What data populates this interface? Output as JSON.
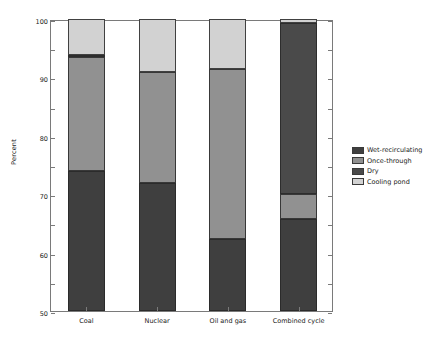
{
  "chart_data": {
    "type": "bar",
    "subtype": "stacked-bar-100-percent",
    "title": "",
    "xlabel": "",
    "ylabel": "Percent",
    "ylim": [
      0,
      100
    ],
    "yticks": [
      0,
      10,
      20,
      30,
      40,
      50,
      60,
      70,
      80,
      90,
      100
    ],
    "grid": false,
    "legend_position": "right",
    "categories": [
      "Coal",
      "Nuclear",
      "Oil and gas",
      "Combined cycle"
    ],
    "series": [
      {
        "name": "Wet-recirculating",
        "color": "#3f3f3f",
        "values": [
          48.0,
          44.0,
          24.5,
          31.5
        ]
      },
      {
        "name": "Once-through",
        "color": "#919191",
        "values": [
          39.0,
          38.0,
          58.5,
          8.5
        ]
      },
      {
        "name": "Dry",
        "color": "#4a4a4a",
        "values": [
          0.6,
          0.0,
          0.0,
          58.8
        ]
      },
      {
        "name": "Cooling pond",
        "color": "#d2d2d2",
        "values": [
          12.4,
          18.0,
          17.0,
          1.2
        ]
      }
    ]
  },
  "axis": {
    "y_title": "Percent",
    "y_tick_labels": [
      "0",
      "10",
      "20",
      "30",
      "40",
      "50",
      "60",
      "70",
      "80",
      "90",
      "100"
    ],
    "x_tick_labels": [
      "Coal",
      "Nuclear",
      "Oil and gas",
      "Combined cycle"
    ]
  },
  "legend": {
    "items": [
      {
        "label": "Wet-recirculating",
        "color": "#3f3f3f"
      },
      {
        "label": "Once-through",
        "color": "#919191"
      },
      {
        "label": "Dry",
        "color": "#4a4a4a"
      },
      {
        "label": "Cooling pond",
        "color": "#d2d2d2"
      }
    ]
  },
  "colors": {
    "axis_line": "#7a7a7a",
    "text": "#1a1a1a",
    "background": "#ffffff"
  }
}
